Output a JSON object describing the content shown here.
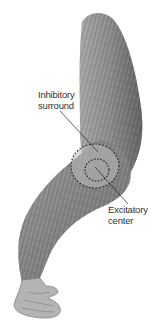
{
  "figure": {
    "labels": {
      "inhibitory": {
        "line1": "Inhibitory",
        "line2": "surround"
      },
      "excitatory": {
        "line1": "Excitatory",
        "line2": "center"
      }
    },
    "colors": {
      "background": "#ffffff",
      "arm_fill": "#8e8e8e",
      "arm_dark": "#5a5a5a",
      "arm_light": "#c8c8c8",
      "dots": "#222222",
      "leader": "#222222",
      "text": "#333333"
    }
  }
}
